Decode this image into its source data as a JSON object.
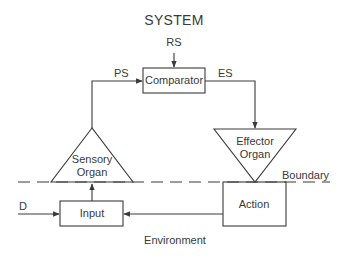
{
  "diagram": {
    "title": "SYSTEM",
    "signals": {
      "reference": "RS",
      "perceptual": "PS",
      "error": "ES",
      "disturbance": "D"
    },
    "nodes": {
      "comparator": "Comparator",
      "sensory_organ": [
        "Sensory",
        "Organ"
      ],
      "effector_organ": [
        "Effector",
        "Organ"
      ],
      "input": "Input",
      "action": "Action"
    },
    "boundary_label": "Boundary",
    "environment_label": "Environment",
    "colors": {
      "stroke": "#3a3a3a",
      "background": "#ffffff"
    }
  }
}
